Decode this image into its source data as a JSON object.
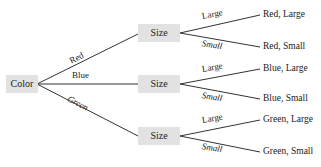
{
  "diagram": {
    "type": "tree",
    "root": {
      "label": "Color"
    },
    "colors": {
      "node_fill": "#e2e2e2",
      "edge": "#333333",
      "text": "#222222"
    },
    "level1_edges": [
      {
        "label": "Red"
      },
      {
        "label": "Blue"
      },
      {
        "label": "Green"
      }
    ],
    "level1_nodes": [
      {
        "label": "Size"
      },
      {
        "label": "Size"
      },
      {
        "label": "Size"
      }
    ],
    "level2_edges": [
      {
        "label": "Large"
      },
      {
        "label": "Small"
      },
      {
        "label": "Large"
      },
      {
        "label": "Small"
      },
      {
        "label": "Large"
      },
      {
        "label": "Small"
      }
    ],
    "leaves": [
      {
        "label": "Red, Large"
      },
      {
        "label": "Red, Small"
      },
      {
        "label": "Blue, Large"
      },
      {
        "label": "Blue, Small"
      },
      {
        "label": "Green, Large"
      },
      {
        "label": "Green, Small"
      }
    ]
  }
}
